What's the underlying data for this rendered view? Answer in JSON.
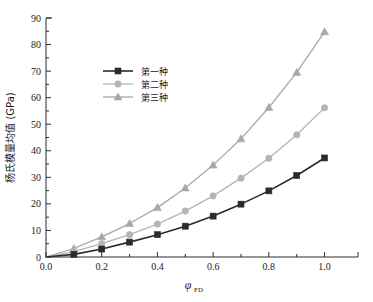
{
  "figure": {
    "type": "line-chart",
    "background": "#ffffff"
  },
  "axes": {
    "x": {
      "label_main": "φ",
      "label_sub": "FD",
      "ticks": [
        "0.0",
        "0.2",
        "0.4",
        "0.6",
        "0.8",
        "1.0"
      ],
      "min": 0.0,
      "max": 1.12
    },
    "y": {
      "label": "杨氏模量均值 (GPa)",
      "ticks": [
        "0",
        "10",
        "20",
        "30",
        "40",
        "50",
        "60",
        "70",
        "80",
        "90"
      ],
      "min": 0,
      "max": 90
    }
  },
  "legend": {
    "items": [
      {
        "label": "第一种",
        "color": "#2b2b2b",
        "marker": "square"
      },
      {
        "label": "第二种",
        "color": "#b5b5b5",
        "marker": "circle"
      },
      {
        "label": "第三种",
        "color": "#a8a8a8",
        "marker": "triangle"
      }
    ]
  },
  "chart_data": {
    "type": "line",
    "title": "",
    "xlabel": "φ_FD",
    "ylabel": "杨氏模量均值 (GPa)",
    "xlim": [
      0.0,
      1.12
    ],
    "ylim": [
      0,
      90
    ],
    "xticks": [
      0.0,
      0.2,
      0.4,
      0.6,
      0.8,
      1.0
    ],
    "yticks": [
      0,
      10,
      20,
      30,
      40,
      50,
      60,
      70,
      80,
      90
    ],
    "grid": false,
    "legend_position": "upper-left-inside",
    "x": [
      0.0,
      0.1,
      0.2,
      0.3,
      0.4,
      0.5,
      0.6,
      0.7,
      0.8,
      0.9,
      1.0
    ],
    "series": [
      {
        "name": "第一种",
        "color": "#2b2b2b",
        "marker": "square",
        "values": [
          0.0,
          1.0,
          3.0,
          5.6,
          8.4,
          11.6,
          15.4,
          19.9,
          24.9,
          30.7,
          37.3
        ]
      },
      {
        "name": "第二种",
        "color": "#b5b5b5",
        "marker": "circle",
        "values": [
          0.0,
          2.0,
          5.0,
          8.4,
          12.4,
          17.3,
          23.0,
          29.7,
          37.2,
          46.0,
          56.2
        ]
      },
      {
        "name": "第三种",
        "color": "#a8a8a8",
        "marker": "triangle",
        "values": [
          0.0,
          3.2,
          7.6,
          12.6,
          18.6,
          26.0,
          34.6,
          44.5,
          56.3,
          69.5,
          84.8
        ]
      }
    ]
  }
}
